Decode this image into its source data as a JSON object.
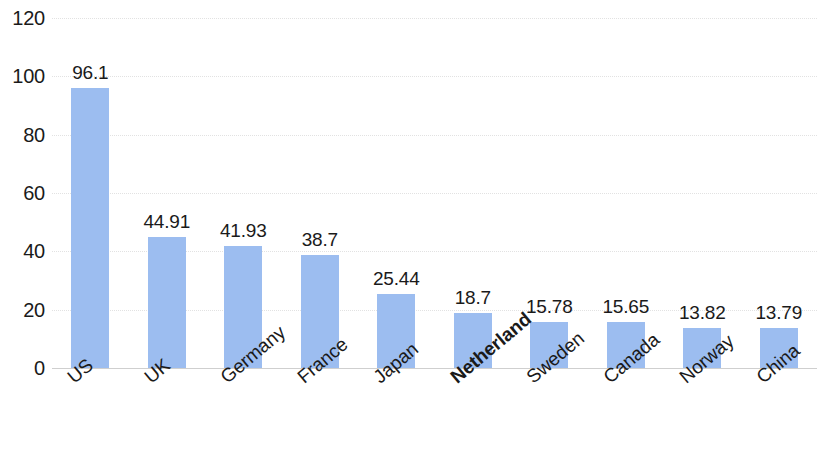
{
  "chart_data": {
    "type": "bar",
    "title": "",
    "subtitle": "",
    "xlabel": "",
    "ylabel": "",
    "categories": [
      "US",
      "UK",
      "Germany",
      "France",
      "Japan",
      "Netherland",
      "Sweden",
      "Canada",
      "Norway",
      "China"
    ],
    "values": [
      96.1,
      44.91,
      41.93,
      38.7,
      25.44,
      18.7,
      15.78,
      15.65,
      13.82,
      13.79
    ],
    "value_labels": [
      "96.1",
      "44.91",
      "41.93",
      "38.7",
      "25.44",
      "18.7",
      "15.78",
      "15.65",
      "13.82",
      "13.79"
    ],
    "series": [
      {
        "name": "",
        "values": [
          96.1,
          44.91,
          41.93,
          38.7,
          25.44,
          18.7,
          15.78,
          15.65,
          13.82,
          13.79
        ]
      }
    ],
    "ylim": [
      0,
      120
    ],
    "yticks": [
      0,
      20,
      40,
      60,
      80,
      100,
      120
    ],
    "ytick_labels": [
      "0",
      "20",
      "40",
      "60",
      "80",
      "100",
      "120"
    ],
    "grid": true,
    "grid_axis": "y",
    "legend": false,
    "legend_position": "none",
    "data_labels": true,
    "bar_color": "#9cbdf0",
    "gridline_color": "#e2e2e2",
    "axis_color": "#cfcfcf",
    "text_color": "#1a1a1a",
    "background_color": "#ffffff",
    "xtick_rotation": -40,
    "emphasized_categories": [
      "Netherland"
    ]
  }
}
